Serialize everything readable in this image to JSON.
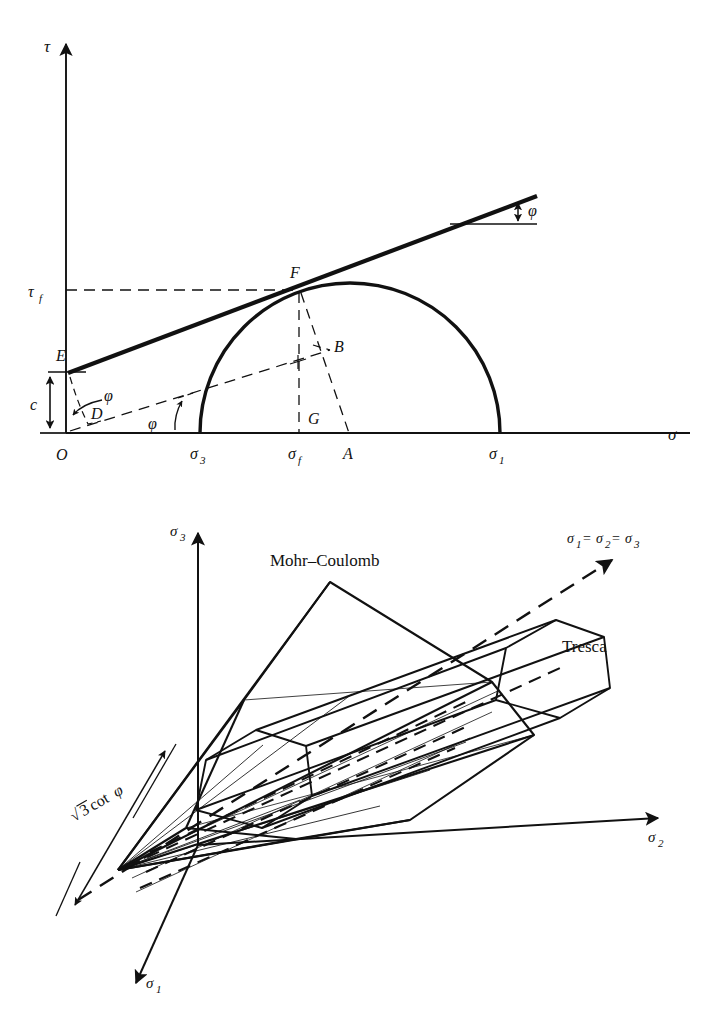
{
  "figure": {
    "domain": "engineering-diagram",
    "title_visible": false,
    "stroke_color": "#111111",
    "background_color": "#ffffff"
  },
  "top_figure": {
    "name": "mohr-coulomb-failure-envelope-mohr-circle",
    "axes": {
      "vertical_label": "τ",
      "horizontal_label": "σ"
    },
    "labels": {
      "origin": "O",
      "point_E": "E",
      "point_D": "D",
      "point_F": "F",
      "point_B": "B",
      "point_G": "G",
      "point_A": "A",
      "cohesion": "c",
      "tau_f": "τ",
      "tau_f_sub": "f",
      "sigma_3": "σ",
      "sigma_3_sub": "3",
      "sigma_f": "σ",
      "sigma_f_sub": "f",
      "sigma_1": "σ",
      "sigma_1_sub": "1",
      "phi_envelope": "φ",
      "phi_lower_left": "φ",
      "phi_lower_mid": "φ"
    }
  },
  "bottom_figure": {
    "name": "principal-stress-space-mohr-coulomb-pyramid-tresca-prism",
    "axes": {
      "sigma_3": "σ",
      "sigma_3_sub": "3",
      "sigma_2": "σ",
      "sigma_2_sub": "2",
      "sigma_1": "σ",
      "sigma_1_sub": "1"
    },
    "labels": {
      "mohr_coulomb": "Mohr–Coulomb",
      "tresca": "Tresca",
      "hydrostatic_axis": "σ₁ = σ₂ = σ₃",
      "hydrostatic_parts": [
        "σ",
        "1",
        " = ",
        "σ",
        "2",
        " = ",
        "σ",
        "3"
      ],
      "apex_distance": "√3 cot φ",
      "apex_distance_parts": [
        "√",
        "3 cot ",
        "φ"
      ]
    }
  }
}
